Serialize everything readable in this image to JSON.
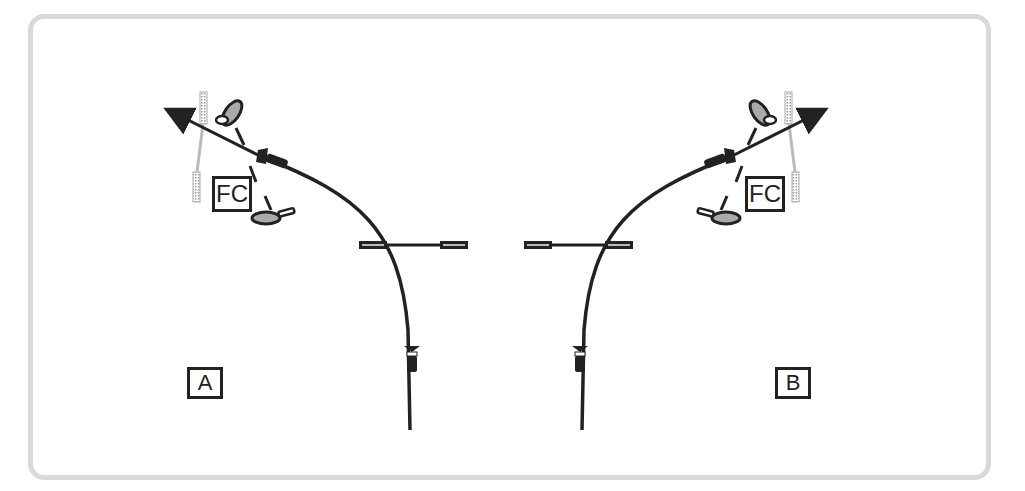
{
  "diagram": {
    "panels": [
      {
        "id": "A",
        "label": "A",
        "fc_label": "FC"
      },
      {
        "id": "B",
        "label": "B",
        "fc_label": "FC"
      }
    ],
    "colors": {
      "line": "#222222",
      "frame": "#d9d9d9",
      "club": "#bbbbbb",
      "foot_fill": "#aaaaaa"
    }
  }
}
